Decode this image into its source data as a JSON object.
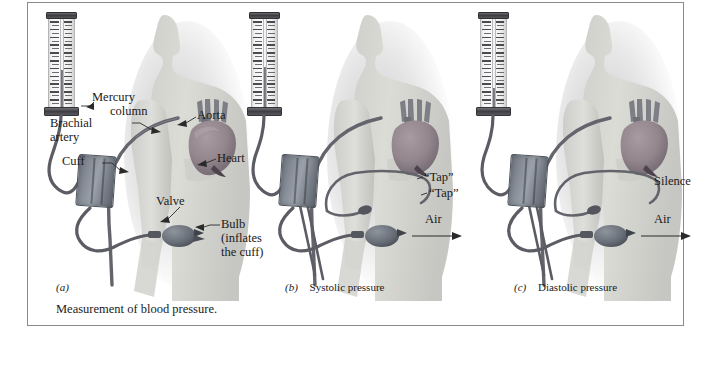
{
  "figure": {
    "caption": "Measurement of blood pressure.",
    "border_color": "#8a8a8a",
    "background": "#ffffff"
  },
  "panels": [
    {
      "id": "a",
      "letter": "(a)",
      "title": "",
      "mercury_level_percent": 42,
      "labels": [
        {
          "name": "mercury-column",
          "text_line1": "Mercury",
          "text_line2": "column"
        },
        {
          "name": "brachial-artery",
          "text_line1": "Brachial",
          "text_line2": "artery"
        },
        {
          "name": "cuff",
          "text_line1": "Cuff",
          "text_line2": ""
        },
        {
          "name": "aorta",
          "text_line1": "Aorta",
          "text_line2": ""
        },
        {
          "name": "heart",
          "text_line1": "Heart",
          "text_line2": ""
        },
        {
          "name": "valve",
          "text_line1": "Valve",
          "text_line2": ""
        },
        {
          "name": "bulb",
          "text_line1": "Bulb",
          "text_line2": "(inflates",
          "text_line3": "the cuff)"
        }
      ]
    },
    {
      "id": "b",
      "letter": "(b)",
      "title": "Systolic pressure",
      "mercury_level_percent": 45,
      "labels": [
        {
          "name": "tap-sound-1",
          "text_line1": "“Tap”"
        },
        {
          "name": "tap-sound-2",
          "text_line1": "“Tap”"
        },
        {
          "name": "air-arrow",
          "text_line1": "Air"
        }
      ]
    },
    {
      "id": "c",
      "letter": "(c)",
      "title": "Diastolic pressure",
      "mercury_level_percent": 22,
      "labels": [
        {
          "name": "silence",
          "text_line1": "Silence"
        },
        {
          "name": "air-arrow",
          "text_line1": "Air"
        }
      ]
    }
  ],
  "colors": {
    "body": "#d6d7d2",
    "body_edge": "#c2c3be",
    "heart": "#9a8d93",
    "heart_dark": "#6f6470",
    "vessel": "#7e7f86",
    "artery": "#6a6b72",
    "cuff": "#868d97",
    "tube": "#5f6067",
    "manometer_frame": "#3c3c41",
    "mercury": "#7d7d84",
    "text": "#1a1a1a"
  }
}
